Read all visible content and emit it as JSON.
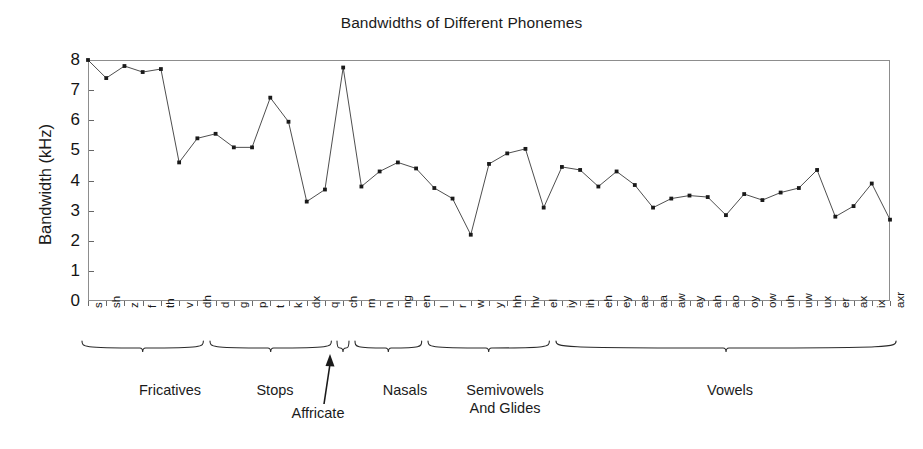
{
  "chart_data": {
    "type": "line",
    "title": "Bandwidths of Different Phonemes",
    "xlabel": "",
    "ylabel": "Bandwidth (kHz)",
    "ylim": [
      0,
      8
    ],
    "yticks": [
      0,
      1,
      2,
      3,
      4,
      5,
      6,
      7,
      8
    ],
    "ytick_labels": [
      "0",
      "1",
      "2",
      "3",
      "4",
      "5",
      "6",
      "7",
      "8"
    ],
    "grid": false,
    "legend": null,
    "marker": "square",
    "line_color": "#3a3a3a",
    "marker_color": "#1a1a1a",
    "categories": [
      "s",
      "sh",
      "z",
      "f",
      "th",
      "v",
      "dh",
      "d",
      "g",
      "p",
      "t",
      "k",
      "dx",
      "q",
      "ch",
      "m",
      "n",
      "ng",
      "en",
      "l",
      "r",
      "w",
      "y",
      "hh",
      "hv",
      "el",
      "iy",
      "ih",
      "eh",
      "ey",
      "ae",
      "aa",
      "aw",
      "ay",
      "ah",
      "ao",
      "oy",
      "ow",
      "uh",
      "uw",
      "ux",
      "er",
      "ax",
      "ix",
      "axr"
    ],
    "values": [
      8.0,
      7.4,
      7.8,
      7.6,
      7.7,
      4.6,
      5.4,
      5.55,
      5.1,
      5.1,
      6.75,
      5.95,
      3.3,
      3.7,
      7.75,
      3.8,
      4.3,
      4.6,
      4.4,
      3.75,
      3.4,
      2.2,
      4.55,
      4.9,
      5.05,
      3.1,
      4.45,
      4.35,
      3.8,
      4.3,
      3.85,
      3.1,
      3.4,
      3.5,
      3.45,
      2.85,
      3.55,
      3.35,
      3.6,
      3.75,
      4.35,
      2.8,
      3.15,
      3.9,
      2.7
    ],
    "groups": [
      {
        "label": "Fricatives",
        "start_index": 0,
        "end_index": 6,
        "label_lines": "Fricatives"
      },
      {
        "label": "Stops",
        "start_index": 7,
        "end_index": 13,
        "label_lines": "Stops"
      },
      {
        "label": "Affricate",
        "start_index": 14,
        "end_index": 14,
        "label_lines": "Affricate"
      },
      {
        "label": "Nasals",
        "start_index": 15,
        "end_index": 18,
        "label_lines": "Nasals"
      },
      {
        "label": "Semivowels And Glides",
        "start_index": 19,
        "end_index": 25,
        "label_lines": "Semivowels\nAnd Glides"
      },
      {
        "label": "Vowels",
        "start_index": 26,
        "end_index": 44,
        "label_lines": "Vowels"
      }
    ]
  }
}
